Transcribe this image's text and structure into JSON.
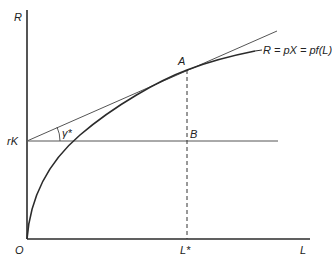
{
  "diagram": {
    "type": "economics-production-revenue",
    "labels": {
      "y_axis": "R",
      "x_axis": "L",
      "origin": "O",
      "rK": "rK",
      "angle": "γ*",
      "point_a": "A",
      "point_b": "B",
      "l_star": "L*",
      "curve": "R = pX = pf(L)"
    },
    "colors": {
      "axis": "#2b2b2b",
      "curve": "#2b2b2b",
      "line": "#555555"
    }
  }
}
